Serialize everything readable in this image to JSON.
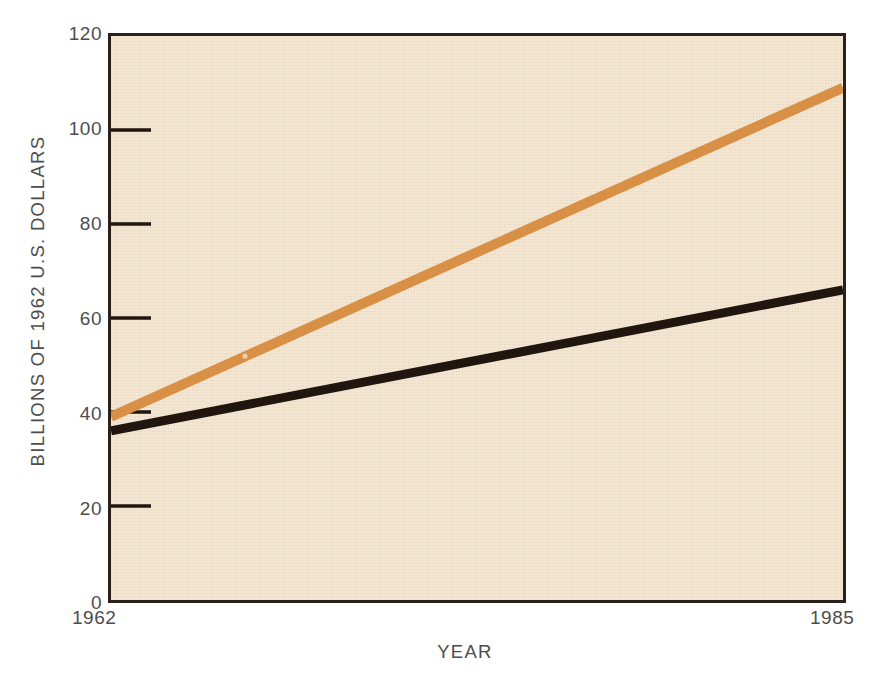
{
  "chart_data": {
    "type": "line",
    "title": "",
    "xlabel": "YEAR",
    "ylabel": "BILLIONS OF 1962 U.S. DOLLARS",
    "xlim": [
      1962,
      1985
    ],
    "ylim": [
      0,
      120
    ],
    "x": [
      1962,
      1985
    ],
    "x_tick_labels": [
      "1962",
      "1985"
    ],
    "y_ticks": [
      0,
      20,
      40,
      60,
      80,
      100,
      120
    ],
    "y_tick_labels": [
      "0",
      "20",
      "40",
      "60",
      "80",
      "100",
      "120"
    ],
    "grid": false,
    "legend": "none",
    "series": [
      {
        "name": "upper-projection",
        "color": "#d88f46",
        "values": [
          39,
          109
        ],
        "line_width_px": 9
      },
      {
        "name": "lower-projection",
        "color": "#20160f",
        "values": [
          36,
          66
        ],
        "line_width_px": 8
      }
    ],
    "colors": {
      "plot_background": "#f4e8d4",
      "page_background": "#ffffff",
      "axis": "#2b211a",
      "tick_text": "#4d4d4d",
      "series_upper": "#d88f46",
      "series_lower": "#20160f"
    }
  },
  "axes": {
    "y_title": "BILLIONS OF 1962 U.S. DOLLARS",
    "x_title": "YEAR",
    "y_labels": {
      "t120": "120",
      "t100": "100",
      "t80": "80",
      "t60": "60",
      "t40": "40",
      "t20": "20",
      "t0": "0"
    },
    "x_labels": {
      "start": "1962",
      "end": "1985"
    }
  }
}
